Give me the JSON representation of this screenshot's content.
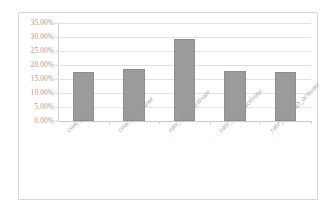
{
  "chart_data": {
    "type": "bar",
    "title": "",
    "subtitle": "",
    "xlabel": "",
    "ylabel": "",
    "categories": [
      "conc_cAMP",
      "conc_arabinose",
      "rate_CRP_activate",
      "rate_araC_activate",
      "rate_araBAD_activate"
    ],
    "values": [
      17.5,
      18.6,
      29.4,
      17.7,
      17.4
    ],
    "value_format": "percent",
    "ylim": [
      0,
      35
    ],
    "ytick_values": [
      0,
      5,
      10,
      15,
      20,
      25,
      30,
      35
    ],
    "ytick_labels": [
      "0.00%",
      "5.00%",
      "10.00%",
      "15.00%",
      "20.00%",
      "25.00%",
      "30.00%",
      "35.00%"
    ],
    "grid": "horizontal",
    "legend": "none",
    "series": [
      {
        "name": "",
        "values": [
          17.5,
          18.6,
          29.4,
          17.7,
          17.4
        ]
      }
    ],
    "colors": {
      "bar_fill": "#9b9b9b",
      "bar_border": "#8e8e8e",
      "gridline": "#e2e2e2",
      "axis": "#cfcfcf",
      "tick_text": "#9d9d9d",
      "category_text": "#9a9a9a",
      "plot_background": "#ffffff",
      "chart_border": "#d8d8d8"
    }
  }
}
